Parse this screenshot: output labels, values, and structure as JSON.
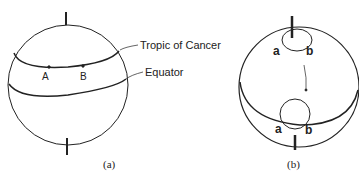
{
  "figure_a": {
    "caption": "(a)",
    "labels": {
      "tropic": "Tropic of Cancer",
      "equator": "Equator",
      "point_a": "A",
      "point_b": "B"
    }
  },
  "figure_b": {
    "caption": "(b)",
    "labels": {
      "top_a": "a",
      "top_b": "b",
      "bottom_a": "a",
      "bottom_b": "b"
    }
  },
  "colors": {
    "stroke": "#222222",
    "background": "#ffffff"
  }
}
